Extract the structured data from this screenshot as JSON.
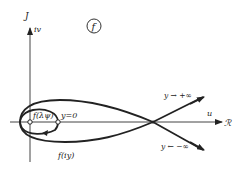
{
  "figure": {
    "panel_label": "f",
    "axes": {
      "vertical_label": "J",
      "vertical_sublabel": "iv",
      "horizontal_label": "u",
      "horizontal_domain": "ℛ"
    },
    "annotations": {
      "point_lambda": "f(λψ)",
      "y_zero": "y=0",
      "curve": "f(iy)",
      "upper_branch": "y → +∞",
      "lower_branch": "y ← −∞"
    },
    "colors": {
      "ink": "#222222",
      "background": "#ffffff"
    }
  }
}
